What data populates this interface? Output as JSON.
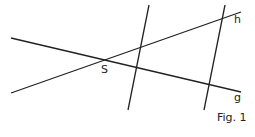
{
  "figure": {
    "caption": "Fig. 1",
    "line_color": "#222222",
    "labels": {
      "vertex": "S",
      "line_h": "h",
      "line_g": "g"
    },
    "lines": [
      {
        "name": "g",
        "x1": 11,
        "y1": 38,
        "x2": 241,
        "y2": 92
      },
      {
        "name": "h",
        "x1": 11,
        "y1": 93,
        "x2": 241,
        "y2": 12
      },
      {
        "name": "parallel-1",
        "x1": 149,
        "y1": 5,
        "x2": 128,
        "y2": 110
      },
      {
        "name": "parallel-2",
        "x1": 225,
        "y1": 5,
        "x2": 204,
        "y2": 110
      }
    ]
  }
}
